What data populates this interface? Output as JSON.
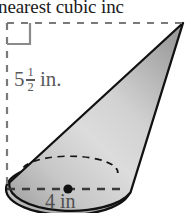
{
  "figure": {
    "type": "cone-volume-diagram",
    "heading_partial_text": "nearest cubic inc",
    "background_color": "#ffffff",
    "outline_color": "#111111",
    "dash_color": "#6e6e6e",
    "label_color": "#545454",
    "fill_light": "#e2e2e2",
    "fill_mid": "#c9c9c9",
    "fill_dark": "#9a9a9a",
    "height_label": {
      "whole": "5",
      "numerator": "1",
      "denominator": "2",
      "unit": "in."
    },
    "diameter_label": {
      "text": "4 in"
    },
    "markers": {
      "right_angle": "right-angle-marker",
      "center_point": "center-dot"
    },
    "geometry": {
      "apex_x": 183,
      "apex_y": 23,
      "base_center_x": 68,
      "base_center_y": 189,
      "base_rx": 62,
      "base_ry": 26,
      "height_line_x": 7,
      "height_line_top_y": 23,
      "height_line_bottom_y": 189
    }
  }
}
